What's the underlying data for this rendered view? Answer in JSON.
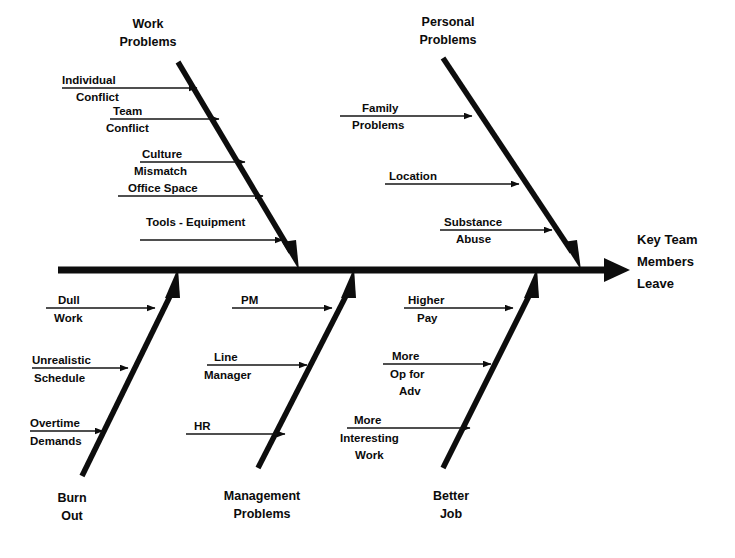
{
  "diagram": {
    "type": "fishbone-ishikawa",
    "effect": {
      "lines": [
        "Key Team",
        "Members",
        "Leave"
      ]
    },
    "categories": [
      {
        "id": "work-problems",
        "label_lines": [
          "Work",
          "Problems"
        ],
        "position": "upper",
        "causes": [
          {
            "label_lines": [
              "Individual",
              "Conflict"
            ]
          },
          {
            "label_lines": [
              "Team",
              "Conflict"
            ]
          },
          {
            "label_lines": [
              "Culture",
              "Mismatch"
            ]
          },
          {
            "label_lines": [
              "Office  Space"
            ]
          },
          {
            "label_lines": [
              "Tools - Equipment"
            ]
          }
        ]
      },
      {
        "id": "personal-problems",
        "label_lines": [
          "Personal",
          "Problems"
        ],
        "position": "upper",
        "causes": [
          {
            "label_lines": [
              "Family",
              "Problems"
            ]
          },
          {
            "label_lines": [
              "Location"
            ]
          },
          {
            "label_lines": [
              "Substance",
              "Abuse"
            ]
          }
        ]
      },
      {
        "id": "burn-out",
        "label_lines": [
          "Burn",
          "Out"
        ],
        "position": "lower",
        "causes": [
          {
            "label_lines": [
              "Dull",
              "Work"
            ]
          },
          {
            "label_lines": [
              "Unrealistic",
              "Schedule"
            ]
          },
          {
            "label_lines": [
              "Overtime",
              "Demands"
            ]
          }
        ]
      },
      {
        "id": "management-problems",
        "label_lines": [
          "Management",
          "Problems"
        ],
        "position": "lower",
        "causes": [
          {
            "label_lines": [
              "PM"
            ]
          },
          {
            "label_lines": [
              "Line",
              "Manager"
            ]
          },
          {
            "label_lines": [
              "HR"
            ]
          }
        ]
      },
      {
        "id": "better-job",
        "label_lines": [
          "Better",
          "Job"
        ],
        "position": "lower",
        "causes": [
          {
            "label_lines": [
              "Higher",
              "Pay"
            ]
          },
          {
            "label_lines": [
              "More",
              "Op for",
              "Adv"
            ]
          },
          {
            "label_lines": [
              "More",
              "Interesting",
              "Work"
            ]
          }
        ]
      }
    ]
  },
  "text": {
    "work_title_1": "Work",
    "work_title_2": "Problems",
    "personal_title_1": "Personal",
    "personal_title_2": "Problems",
    "burnout_title_1": "Burn",
    "burnout_title_2": "Out",
    "management_title_1": "Management",
    "management_title_2": "Problems",
    "betterjob_title_1": "Better",
    "betterjob_title_2": "Job",
    "effect_1": "Key Team",
    "effect_2": "Members",
    "effect_3": "Leave",
    "c_individual": "Individual",
    "c_conflict1": "Conflict",
    "c_team": "Team",
    "c_conflict2": "Conflict",
    "c_culture": "Culture",
    "c_mismatch": "Mismatch",
    "c_office_space": "Office  Space",
    "c_tools_equipment": "Tools - Equipment",
    "c_family": "Family",
    "c_problems": "Problems",
    "c_location": "Location",
    "c_substance": "Substance",
    "c_abuse": "Abuse",
    "c_dull": "Dull",
    "c_work": "Work",
    "c_unrealistic": "Unrealistic",
    "c_schedule": "Schedule",
    "c_overtime": "Overtime",
    "c_demands": "Demands",
    "c_pm": "PM",
    "c_line": "Line",
    "c_manager": "Manager",
    "c_hr": "HR",
    "c_higher": "Higher",
    "c_pay": "Pay",
    "c_more1": "More",
    "c_op_for": "Op for",
    "c_adv": "Adv",
    "c_more2": "More",
    "c_interesting": "Interesting",
    "c_work2": "Work"
  },
  "colors": {
    "ink": "#0d0d0d",
    "background": "#ffffff"
  }
}
